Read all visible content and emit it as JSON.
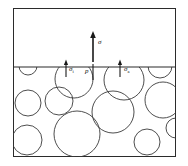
{
  "figure": {
    "frame": {
      "x": 13,
      "y": 8,
      "width": 163,
      "height": 149
    },
    "interface": {
      "label": "interface-line",
      "y": 67,
      "x_start": 13,
      "x_end": 176
    },
    "labels": [
      {
        "id": "applied-stress",
        "symbol": "σ",
        "subscript": "",
        "x": 98,
        "y": 43,
        "description": "applied stress arrow label above interface"
      },
      {
        "id": "internal-stress",
        "symbol": "σ",
        "subscript": "i",
        "x": 70,
        "y": 69,
        "description": "internal stress on left particle"
      },
      {
        "id": "pressure",
        "symbol": "p",
        "subscript": "",
        "x": 88,
        "y": 70,
        "description": "pressure at contact point"
      },
      {
        "id": "surface-stress",
        "symbol": "σ",
        "subscript": "a",
        "x": 126,
        "y": 69,
        "description": "stress on right particle"
      }
    ],
    "arrows": [
      {
        "id": "arrow-applied",
        "x": 93,
        "y_tail": 55,
        "y_head": 34,
        "weight": "thick"
      },
      {
        "id": "arrow-internal",
        "x": 66,
        "y_tail": 75,
        "y_head": 60,
        "weight": "thin"
      },
      {
        "id": "arrow-pressure",
        "x": 93,
        "y_tail": 78,
        "y_head": 60,
        "weight": "thin"
      },
      {
        "id": "arrow-surface",
        "x": 120,
        "y_tail": 75,
        "y_head": 60,
        "weight": "thin"
      }
    ],
    "particles": [
      {
        "cx": 28,
        "cy": 66,
        "r": 9
      },
      {
        "cx": 74,
        "cy": 79,
        "r": 19
      },
      {
        "cx": 124,
        "cy": 80,
        "r": 20
      },
      {
        "cx": 160,
        "cy": 66,
        "r": 12
      },
      {
        "cx": 163,
        "cy": 100,
        "r": 18
      },
      {
        "cx": 28,
        "cy": 103,
        "r": 13
      },
      {
        "cx": 59,
        "cy": 101,
        "r": 14
      },
      {
        "cx": 113,
        "cy": 112,
        "r": 21
      },
      {
        "cx": 77,
        "cy": 134,
        "r": 23
      },
      {
        "cx": 27,
        "cy": 140,
        "r": 15
      },
      {
        "cx": 147,
        "cy": 142,
        "r": 13
      },
      {
        "cx": 176,
        "cy": 128,
        "r": 10
      }
    ],
    "colors": {
      "stroke": "#2b2b2b",
      "particle_stroke": "#3a3a3a",
      "arrow": "#1a1a1a",
      "background": "#ffffff"
    }
  }
}
